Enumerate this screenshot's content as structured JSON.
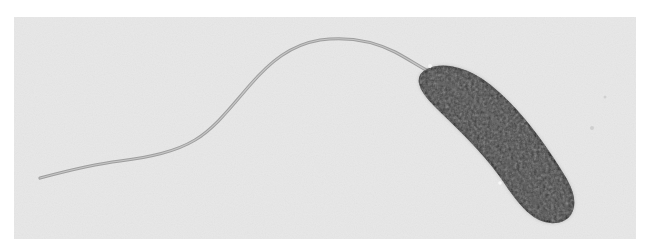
{
  "image": {
    "subject": "comma-shaped bacterium with single polar flagellum",
    "style": "grayscale electron micrograph",
    "colors": {
      "page_background": "#ffffff",
      "field_background": "#e6e6e6",
      "flagellum": "#a8a8a8",
      "cell_body": "#3a3a3a",
      "cell_outline": "#1e1e1e"
    }
  }
}
